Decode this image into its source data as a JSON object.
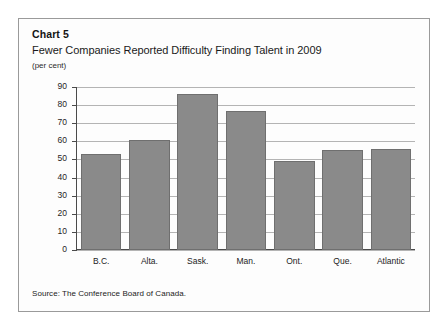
{
  "figure": {
    "chart_number": "Chart 5",
    "title": "Fewer Companies Reported Difficulty Finding Talent in 2009",
    "units": "(per cent)",
    "source": "Source: The Conference Board of Canada."
  },
  "chart_data": {
    "type": "bar",
    "title": "Fewer Companies Reported Difficulty Finding Talent in 2009",
    "subtitle": "Chart 5",
    "xlabel": "",
    "ylabel": "(per cent)",
    "categories": [
      "B.C.",
      "Alta.",
      "Sask.",
      "Man.",
      "Ont.",
      "Que.",
      "Atlantic"
    ],
    "values": [
      53,
      61,
      86,
      77,
      49,
      55,
      56
    ],
    "ylim": [
      0,
      90
    ],
    "ytick_step": 10,
    "yticks": [
      90,
      80,
      70,
      60,
      50,
      40,
      30,
      20,
      10,
      0
    ],
    "grid": true,
    "legend": false,
    "bar_color": "#8a8a8a",
    "bar_edge_color": "#6f6f6f",
    "axis_color": "#4a4a4a",
    "grid_color": "#b4b4b4"
  }
}
